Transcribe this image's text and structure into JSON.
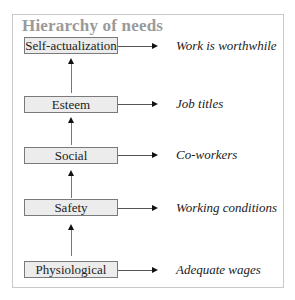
{
  "title": "Hierarchy of needs",
  "levels": [
    {
      "need": "Self-actualization",
      "example": "Work is worthwhile"
    },
    {
      "need": "Esteem",
      "example": "Job titles"
    },
    {
      "need": "Social",
      "example": "Co-workers"
    },
    {
      "need": "Safety",
      "example": "Working conditions"
    },
    {
      "need": "Physiological",
      "example": "Adequate wages"
    }
  ],
  "colors": {
    "title": "#9a9a9a",
    "box_fill": "#ececec",
    "box_border": "#7a7a7a",
    "frame_border": "#c8c8c8"
  }
}
